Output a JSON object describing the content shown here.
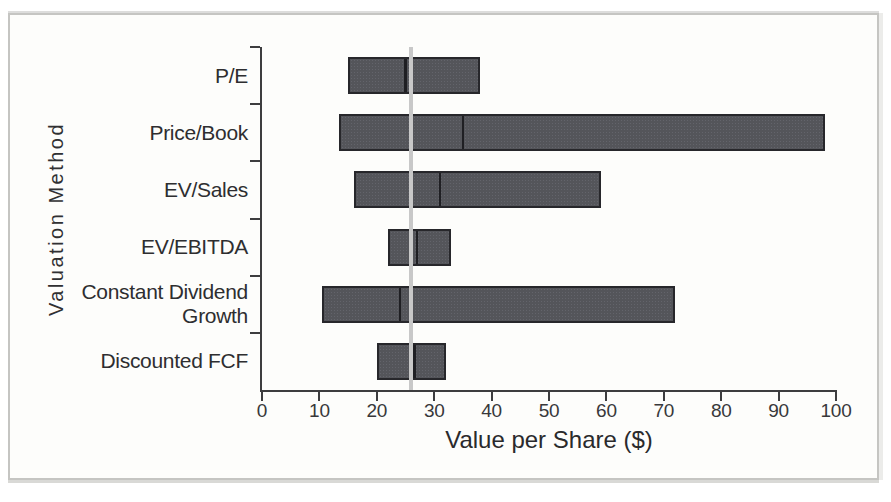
{
  "chart_data": {
    "type": "bar",
    "subtype": "horizontal-range-bar",
    "orientation": "horizontal",
    "title": "",
    "xlabel": "Value per Share ($)",
    "ylabel": "Valuation Method",
    "xlim": [
      0,
      100
    ],
    "xticks": [
      0,
      10,
      20,
      30,
      40,
      50,
      60,
      70,
      80,
      90,
      100
    ],
    "grid": false,
    "legend": "none",
    "categories": [
      "P/E",
      "Price/Book",
      "EV/Sales",
      "EV/EBITDA",
      "Constant Dividend\nGrowth",
      "Discounted FCF"
    ],
    "series": [
      {
        "name": "valuation range low",
        "values": [
          15,
          13.5,
          16,
          22,
          10.5,
          20
        ]
      },
      {
        "name": "valuation range midpoint",
        "values": [
          25,
          35,
          31,
          27,
          24,
          26.5
        ]
      },
      {
        "name": "valuation range high",
        "values": [
          38,
          98,
          59,
          33,
          72,
          32
        ]
      }
    ],
    "reference_line": {
      "axis": "x",
      "value": 26
    }
  },
  "colors": {
    "background": "#fdfdfb",
    "frame_border": "#c5c5c2",
    "axis": "#3d3d3f",
    "text": "#2e2e30",
    "bar_fill": "#54555a",
    "bar_border": "#27272b",
    "mid_tick": "#1f1f23",
    "reference_line": "#c8c8c8"
  }
}
